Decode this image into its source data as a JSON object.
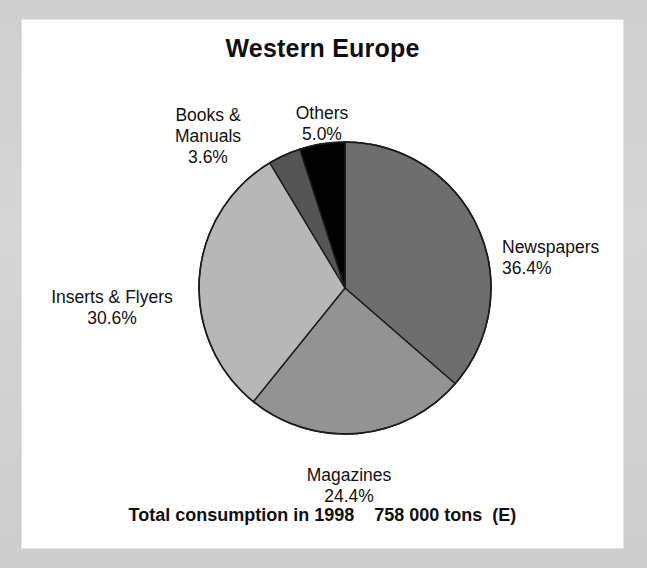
{
  "chart": {
    "title": "Western Europe",
    "footer": "Total consumption in 1998    758 000 tons  (E)"
  },
  "labels": {
    "newspapers": {
      "name": "Newspapers",
      "pct": "36.4%"
    },
    "magazines": {
      "name": "Magazines",
      "pct": "24.4%"
    },
    "inserts": {
      "name": "Inserts & Flyers",
      "pct": "30.6%"
    },
    "books": {
      "name": "Books &\nManuals",
      "pct": "3.6%"
    },
    "others": {
      "name": "Others",
      "pct": "5.0%"
    }
  },
  "chart_data": {
    "type": "pie",
    "title": "Western Europe",
    "subtitle": "Total consumption in 1998    758 000 tons  (E)",
    "unit": "percent",
    "total_label": "758 000 tons",
    "year": "1998",
    "estimate_flag": "(E)",
    "start_angle_deg": 0,
    "direction": "clockwise",
    "legend": "none (direct labels)",
    "categories": [
      "Newspapers",
      "Magazines",
      "Inserts & Flyers",
      "Books & Manuals",
      "Others"
    ],
    "values": [
      36.4,
      24.4,
      30.6,
      3.6,
      5.0
    ],
    "colors": [
      "#6e6e6e",
      "#939393",
      "#b7b7b7",
      "#555555",
      "#000000"
    ],
    "slices": [
      {
        "label": "Newspapers",
        "value": 36.4,
        "display": "36.4%",
        "color": "#6e6e6e",
        "start_deg": 0.0,
        "end_deg": 131.0
      },
      {
        "label": "Magazines",
        "value": 24.4,
        "display": "24.4%",
        "color": "#939393",
        "start_deg": 131.0,
        "end_deg": 218.9
      },
      {
        "label": "Inserts & Flyers",
        "value": 30.6,
        "display": "30.6%",
        "color": "#b7b7b7",
        "start_deg": 218.9,
        "end_deg": 329.0
      },
      {
        "label": "Books & Manuals",
        "value": 3.6,
        "display": "3.6%",
        "color": "#555555",
        "start_deg": 329.0,
        "end_deg": 342.0
      },
      {
        "label": "Others",
        "value": 5.0,
        "display": "5.0%",
        "color": "#000000",
        "start_deg": 342.0,
        "end_deg": 360.0
      }
    ]
  }
}
